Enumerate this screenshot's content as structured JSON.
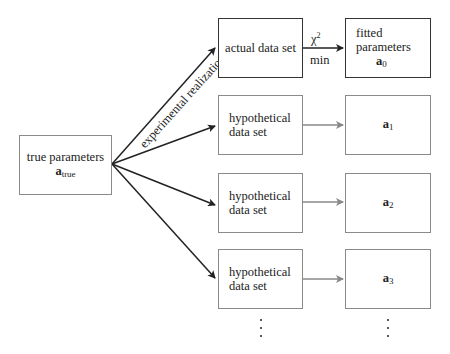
{
  "diagram": {
    "true_params": {
      "line1": "true parameters",
      "symbol": "a",
      "sub": "true"
    },
    "actual": {
      "label": "actual data set"
    },
    "fitted": {
      "line1": "fitted",
      "line2": "parameters",
      "symbol": "a",
      "sub": "0"
    },
    "chi_label": {
      "top": "χ",
      "sup": "2",
      "bottom": "min"
    },
    "arrow_label": "experimental realization",
    "hypothetical": [
      {
        "line1": "hypothetical",
        "line2": "data set",
        "symbol": "a",
        "sub": "1"
      },
      {
        "line1": "hypothetical",
        "line2": "data set",
        "symbol": "a",
        "sub": "2"
      },
      {
        "line1": "hypothetical",
        "line2": "data set",
        "symbol": "a",
        "sub": "3"
      }
    ],
    "dots": "⋮"
  }
}
